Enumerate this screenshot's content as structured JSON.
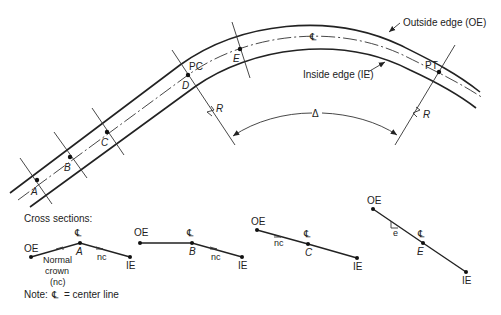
{
  "figure": {
    "type": "horizontal curve superelevation diagram",
    "plan_view": {
      "labels": {
        "outside_edge": "Outside edge (OE)",
        "inside_edge": "Inside edge (IE)",
        "centerline_symbol": "℄",
        "pc": "PC",
        "pt": "PT",
        "radius_left": "R",
        "radius_right": "R",
        "delta": "Δ"
      },
      "stations": [
        "A",
        "B",
        "C",
        "D",
        "E"
      ]
    },
    "cross_sections": {
      "title": "Cross sections:",
      "sections": [
        {
          "station": "A",
          "oe": "OE",
          "ie": "IE",
          "cl": "℄",
          "note": "nc",
          "crown_label_1": "Normal",
          "crown_label_2": "crown",
          "crown_label_3": "(nc)"
        },
        {
          "station": "B",
          "oe": "OE",
          "ie": "IE",
          "cl": "℄",
          "note": "nc"
        },
        {
          "station": "C",
          "oe": "OE",
          "ie": "IE",
          "cl": "℄",
          "note": "nc"
        },
        {
          "station": "E",
          "oe": "OE",
          "ie": "IE",
          "cl": "℄",
          "note": "e"
        }
      ]
    },
    "note": {
      "prefix": "Note:",
      "symbol": "℄",
      "text": "= center line"
    }
  }
}
